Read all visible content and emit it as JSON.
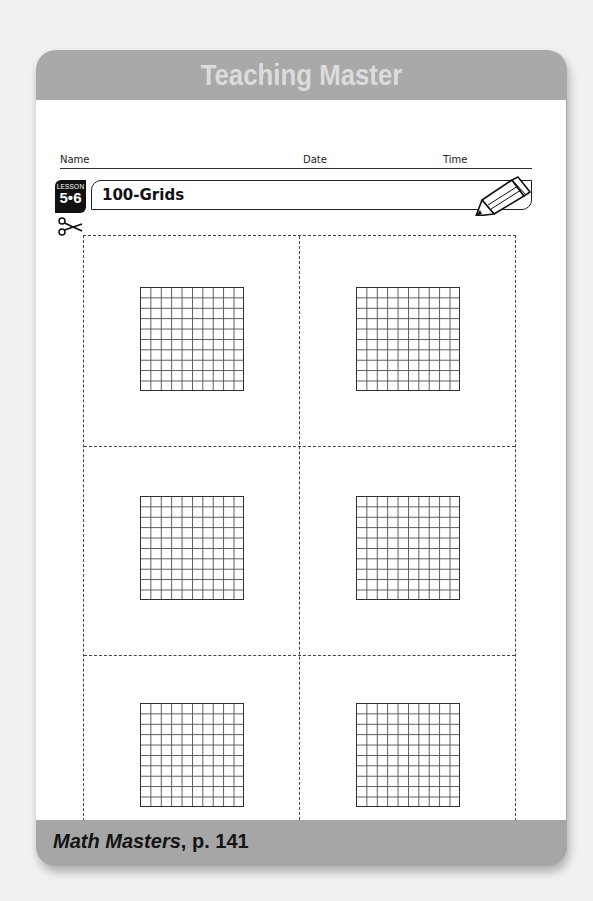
{
  "card": {
    "title": "Teaching Master",
    "header_color": "#a9a9a9",
    "title_color": "#dcdcdc"
  },
  "student_fields": {
    "name_label": "Name",
    "date_label": "Date",
    "time_label": "Time"
  },
  "lesson": {
    "badge_label": "LESSON",
    "number": "5•6",
    "title": "100-Grids"
  },
  "icons": {
    "scissors": "scissors-icon",
    "pencil": "pencil-icon"
  },
  "cut_sheet": {
    "rows": 3,
    "columns": 2,
    "grids": [
      {
        "position": "row-1-left",
        "rows": 10,
        "columns": 10
      },
      {
        "position": "row-1-right",
        "rows": 10,
        "columns": 10
      },
      {
        "position": "row-2-left",
        "rows": 10,
        "columns": 10
      },
      {
        "position": "row-2-right",
        "rows": 10,
        "columns": 10
      },
      {
        "position": "row-3-left",
        "rows": 10,
        "columns": 10
      },
      {
        "position": "row-3-right",
        "rows": 10,
        "columns": 10
      }
    ]
  },
  "footer": {
    "source_title": "Math Masters",
    "source_page": ", p. 141"
  }
}
